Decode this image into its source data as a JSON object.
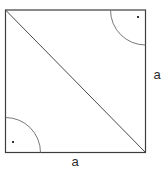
{
  "figure": {
    "type": "geometry-diagram",
    "labels": {
      "right_side": "a",
      "bottom_side": "a"
    },
    "shapes": {
      "square_sides_equal": true,
      "diagonal": "top-left to bottom-right",
      "marked_angles": [
        {
          "corner": "top-right",
          "mark": "arc-with-dot"
        },
        {
          "corner": "bottom-left",
          "mark": "arc-with-dot"
        }
      ]
    },
    "colors": {
      "background": "#ffffff",
      "outline": "#3d3d3d",
      "diagonal": "#4a4a4a",
      "arc": "#6a6a6a",
      "dot": "#333333",
      "label": "#2b2b2b"
    }
  }
}
